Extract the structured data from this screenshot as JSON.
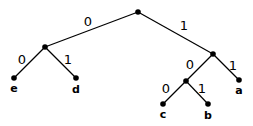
{
  "diagram": {
    "type": "binary code tree",
    "nodes": [
      {
        "id": "root",
        "x": 138,
        "y": 12,
        "label": ""
      },
      {
        "id": "n0",
        "x": 45,
        "y": 47,
        "label": ""
      },
      {
        "id": "n1",
        "x": 213,
        "y": 54,
        "label": ""
      },
      {
        "id": "n10",
        "x": 186,
        "y": 81,
        "label": ""
      },
      {
        "id": "e",
        "x": 14,
        "y": 78,
        "label": "e",
        "label_y": 89
      },
      {
        "id": "d",
        "x": 76,
        "y": 78,
        "label": "d",
        "label_y": 90
      },
      {
        "id": "a",
        "x": 239,
        "y": 80,
        "label": "a",
        "label_y": 91
      },
      {
        "id": "c",
        "x": 163,
        "y": 104,
        "label": "c",
        "label_y": 115
      },
      {
        "id": "b",
        "x": 208,
        "y": 104,
        "label": "b",
        "label_y": 116
      }
    ],
    "edges": [
      {
        "from": "root",
        "to": "n0",
        "bit": "0",
        "label_x": 88,
        "label_y": 22
      },
      {
        "from": "root",
        "to": "n1",
        "bit": "1",
        "label_x": 184,
        "label_y": 26
      },
      {
        "from": "n0",
        "to": "e",
        "bit": "0",
        "label_x": 22,
        "label_y": 60
      },
      {
        "from": "n0",
        "to": "d",
        "bit": "1",
        "label_x": 68,
        "label_y": 60
      },
      {
        "from": "n1",
        "to": "n10",
        "bit": "0",
        "label_x": 190,
        "label_y": 65
      },
      {
        "from": "n1",
        "to": "a",
        "bit": "1",
        "label_x": 233,
        "label_y": 66
      },
      {
        "from": "n10",
        "to": "c",
        "bit": "0",
        "label_x": 166,
        "label_y": 89
      },
      {
        "from": "n10",
        "to": "b",
        "bit": "1",
        "label_x": 202,
        "label_y": 89
      }
    ],
    "colors": {
      "line": "#000000",
      "node": "#000000",
      "background": "#ffffff"
    }
  }
}
